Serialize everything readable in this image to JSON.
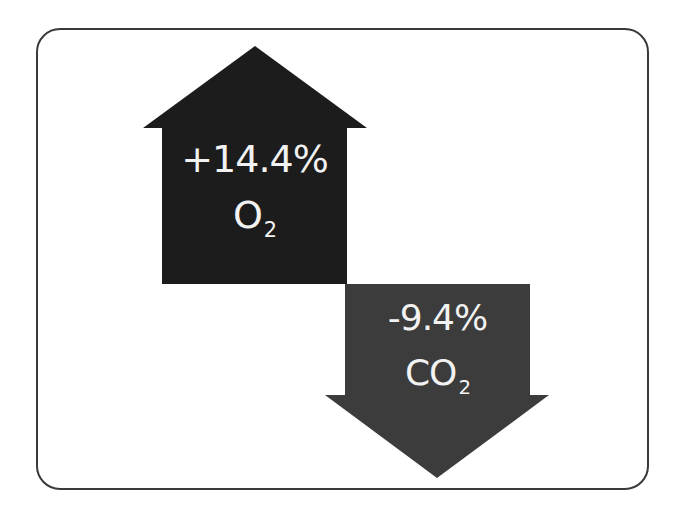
{
  "diagram": {
    "colors": {
      "up_arrow": "#1c1c1c",
      "down_arrow": "#3c3c3c",
      "text": "#f2f2f2",
      "frame_border": "#3a3a3a"
    },
    "up_arrow": {
      "direction": "up",
      "value": "+14.4%",
      "gas": "O",
      "gas_subscript": "2"
    },
    "down_arrow": {
      "direction": "down",
      "value": "-9.4%",
      "gas": "CO",
      "gas_subscript": "2"
    }
  }
}
